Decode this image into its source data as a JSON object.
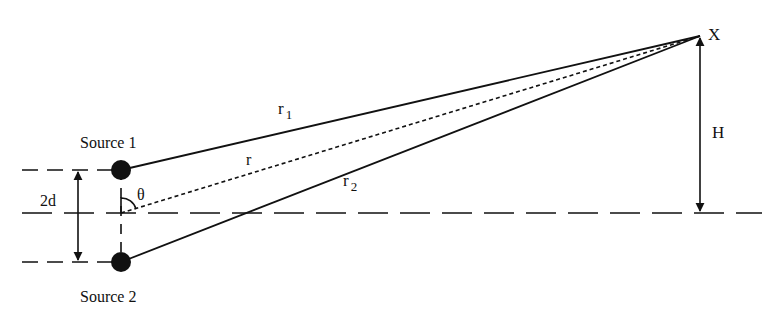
{
  "diagram": {
    "colors": {
      "ink": "#111111",
      "background": "#ffffff"
    },
    "labels": {
      "source1": "Source 1",
      "source2": "Source 2",
      "point": "X",
      "height": "H",
      "separation": "2d",
      "angle": "θ",
      "r": "r",
      "r1_base": "r",
      "r1_sub": "1",
      "r2_base": "r",
      "r2_sub": "2"
    },
    "elements": [
      {
        "name": "source-1",
        "type": "filled-circle",
        "label": "Source 1"
      },
      {
        "name": "source-2",
        "type": "filled-circle",
        "label": "Source 2"
      },
      {
        "name": "path-r1",
        "type": "solid-line",
        "from": "Source 1",
        "to": "X",
        "label": "r1"
      },
      {
        "name": "path-r2",
        "type": "solid-line",
        "from": "Source 2",
        "to": "X",
        "label": "r2"
      },
      {
        "name": "path-r",
        "type": "dashed-line",
        "from": "midpoint",
        "to": "X",
        "label": "r"
      },
      {
        "name": "height-arrow",
        "type": "double-arrow",
        "label": "H"
      },
      {
        "name": "separation-arrow",
        "type": "double-arrow",
        "label": "2d"
      },
      {
        "name": "angle-arc",
        "type": "arc",
        "label": "θ"
      },
      {
        "name": "center-axis",
        "type": "dashed-line"
      }
    ]
  }
}
